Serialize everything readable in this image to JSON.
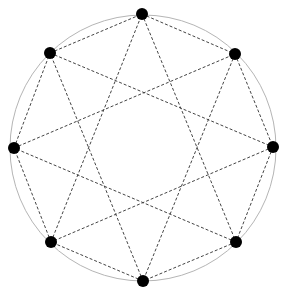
{
  "diagram": {
    "type": "star-polygon",
    "circle": {
      "cx": 143,
      "cy": 148,
      "r": 133,
      "stroke": "#b5b5b5"
    },
    "vertex_color": "#000000",
    "edge_color": "#444444",
    "vertex_radius": 6,
    "vertices": [
      {
        "id": "V0",
        "x": 142,
        "y": 14
      },
      {
        "id": "V1",
        "x": 235,
        "y": 54
      },
      {
        "id": "V2",
        "x": 273,
        "y": 147
      },
      {
        "id": "V3",
        "x": 236,
        "y": 242
      },
      {
        "id": "V4",
        "x": 143,
        "y": 281
      },
      {
        "id": "V5",
        "x": 51,
        "y": 242
      },
      {
        "id": "V6",
        "x": 14,
        "y": 148
      },
      {
        "id": "V7",
        "x": 50,
        "y": 53
      }
    ],
    "edges": [
      [
        0,
        1
      ],
      [
        1,
        2
      ],
      [
        2,
        3
      ],
      [
        3,
        4
      ],
      [
        4,
        5
      ],
      [
        5,
        6
      ],
      [
        6,
        7
      ],
      [
        7,
        0
      ],
      [
        0,
        3
      ],
      [
        1,
        4
      ],
      [
        2,
        5
      ],
      [
        3,
        6
      ],
      [
        4,
        7
      ],
      [
        5,
        0
      ],
      [
        6,
        1
      ],
      [
        7,
        2
      ]
    ]
  }
}
